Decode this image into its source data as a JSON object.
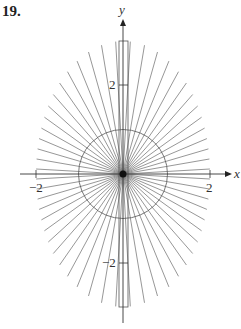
{
  "problem": {
    "number": "19."
  },
  "chart_data": {
    "type": "line",
    "title": "",
    "xlabel": "x",
    "ylabel": "y",
    "xlim": [
      -2.3,
      2.4
    ],
    "ylim": [
      -3.4,
      3.5
    ],
    "x_ticks": [
      {
        "value": -2,
        "label": "−2"
      },
      {
        "value": 2,
        "label": "2"
      }
    ],
    "y_ticks": [
      {
        "value": 2,
        "label": "2"
      },
      {
        "value": -2,
        "label": "−2"
      }
    ],
    "grid": false,
    "legend": null,
    "rays": {
      "count": 56,
      "envelope_semi_axes": [
        2,
        3
      ]
    },
    "circle": {
      "center": [
        0,
        0
      ],
      "radius": 1
    },
    "rectangle": {
      "x": [
        -0.1,
        0.1
      ],
      "y": [
        -3,
        3
      ]
    }
  },
  "labels": {
    "x_axis": "x",
    "y_axis": "y",
    "xtick_neg": "−2",
    "xtick_pos": "2",
    "ytick_pos": "2",
    "ytick_neg": "−2"
  },
  "colors": {
    "rays": "#6a6a6a",
    "axes": "#333333",
    "circle": "#555555"
  }
}
